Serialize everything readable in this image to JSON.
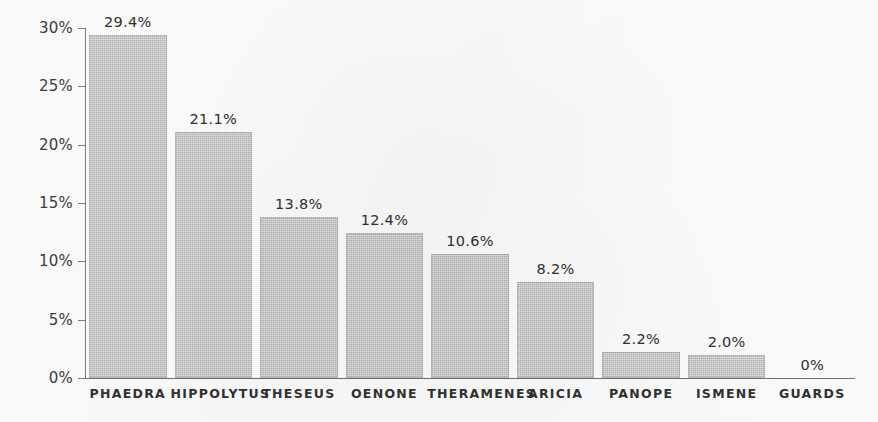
{
  "chart_data": {
    "type": "bar",
    "title": "",
    "subtitle": "",
    "xlabel": "",
    "ylabel": "",
    "categories": [
      "PHAEDRA",
      "HIPPOLYTUS",
      "THESEUS",
      "OENONE",
      "THERAMENES",
      "ARICIA",
      "PANOPE",
      "ISMENE",
      "GUARDS"
    ],
    "values": [
      29.4,
      21.1,
      13.8,
      12.4,
      10.6,
      8.2,
      2.2,
      2.0,
      0
    ],
    "value_labels": [
      "29.4%",
      "21.1%",
      "13.8%",
      "12.4%",
      "10.6%",
      "8.2%",
      "2.2%",
      "2.0%",
      "0%"
    ],
    "ylim": [
      0,
      30
    ],
    "yticks": [
      0,
      5,
      10,
      15,
      20,
      25,
      30
    ],
    "ytick_labels": [
      "0%",
      "5%",
      "10%",
      "15%",
      "20%",
      "25%",
      "30%"
    ],
    "grid": false,
    "legend": null,
    "bar_color": "#c6c6c6",
    "axis_color": "#7c7c7c",
    "text_color": "#2f2f2f",
    "background_color": "#fcfcfc"
  }
}
